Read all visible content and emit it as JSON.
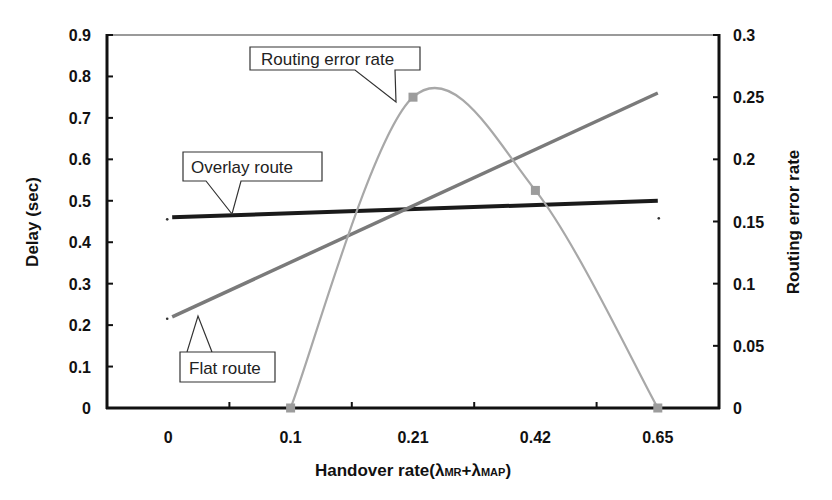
{
  "chart_data": {
    "type": "line",
    "title": "",
    "xlabel": "Handover rate(λMR+λMAP)",
    "xlabel_parts": {
      "main": "Handover rate(",
      "l1": "λ",
      "s1": "MR",
      "plus": "+",
      "l2": "λ",
      "s2": "MAP",
      "close": ")"
    },
    "ylabel": "Delay (sec)",
    "y2label": "Routing error rate",
    "categories": [
      "0",
      "0.1",
      "0.21",
      "0.42",
      "0.65"
    ],
    "ylim": [
      0,
      0.9
    ],
    "yticks": [
      "0",
      "0.1",
      "0.2",
      "0.3",
      "0.4",
      "0.5",
      "0.6",
      "0.7",
      "0.8",
      "0.9"
    ],
    "y2lim": [
      0,
      0.3
    ],
    "y2ticks": [
      "0",
      "0.05",
      "0.1",
      "0.15",
      "0.2",
      "0.25",
      "0.3"
    ],
    "grid": false,
    "legend": "callout labels",
    "series": [
      {
        "name": "Overlay route",
        "axis": "left",
        "style": "linear trend",
        "color": "#1a1a1a",
        "start": 0.46,
        "end": 0.5
      },
      {
        "name": "Flat route",
        "axis": "left",
        "style": "linear trend",
        "color": "#7a7a7a",
        "start": 0.22,
        "end": 0.76
      },
      {
        "name": "Routing error rate",
        "axis": "right",
        "style": "smoothed with square markers",
        "color": "#a8a8a8",
        "values": [
          null,
          0,
          0.25,
          0.175,
          0
        ]
      }
    ]
  },
  "labels": {
    "overlay": "Overlay route",
    "flat": "Flat route",
    "error": "Routing error rate"
  }
}
